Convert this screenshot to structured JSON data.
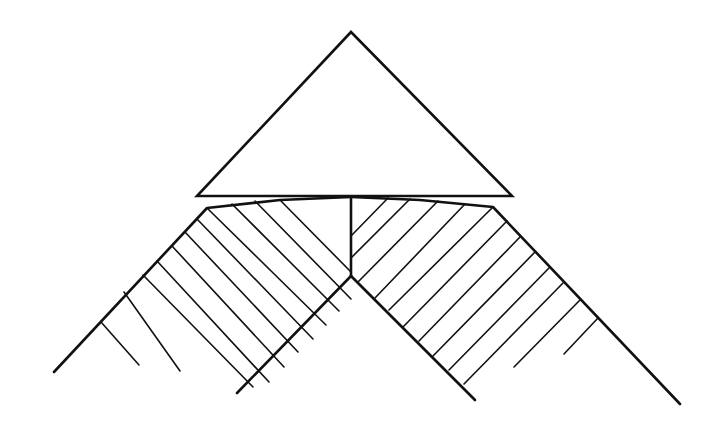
{
  "diagram": {
    "colors": {
      "ink": "#111111",
      "background": "#ffffff"
    },
    "triangle": {
      "points": [
        [
          351,
          32
        ],
        [
          512,
          196
        ],
        [
          197,
          196
        ]
      ]
    },
    "band_outline": {
      "left_outer": [
        [
          54,
          372
        ],
        [
          207,
          208
        ],
        [
          280,
          200
        ],
        [
          351,
          197
        ]
      ],
      "left_inner": [
        [
          237,
          393
        ],
        [
          351,
          276
        ]
      ],
      "right_outer": [
        [
          351,
          197
        ],
        [
          420,
          200
        ],
        [
          493,
          207
        ],
        [
          680,
          404
        ]
      ],
      "right_inner": [
        [
          351,
          276
        ],
        [
          475,
          400
        ]
      ],
      "center_divider": [
        [
          351,
          197
        ],
        [
          351,
          276
        ]
      ]
    },
    "hatch_lines": {
      "left": [
        [
          [
            280,
            200
          ],
          [
            351,
            272
          ]
        ],
        [
          [
            255,
            201
          ],
          [
            351,
            299
          ]
        ],
        [
          [
            232,
            204
          ],
          [
            339,
            311
          ]
        ],
        [
          [
            207,
            208
          ],
          [
            326,
            325
          ]
        ],
        [
          [
            197,
            219
          ],
          [
            313,
            339
          ]
        ],
        [
          [
            185,
            232
          ],
          [
            298,
            352
          ]
        ],
        [
          [
            172,
            246
          ],
          [
            284,
            367
          ]
        ],
        [
          [
            157,
            261
          ],
          [
            269,
            382
          ]
        ],
        [
          [
            143,
            275
          ],
          [
            253,
            387
          ]
        ],
        [
          [
            124,
            292
          ],
          [
            180,
            371
          ]
        ],
        [
          [
            101,
            322
          ],
          [
            139,
            365
          ]
        ]
      ],
      "right": [
        [
          [
            388,
            198
          ],
          [
            351,
            236
          ]
        ],
        [
          [
            410,
            199
          ],
          [
            351,
            258
          ]
        ],
        [
          [
            438,
            201
          ],
          [
            358,
            282
          ]
        ],
        [
          [
            465,
            204
          ],
          [
            375,
            298
          ]
        ],
        [
          [
            493,
            207
          ],
          [
            389,
            310
          ]
        ],
        [
          [
            507,
            221
          ],
          [
            403,
            327
          ]
        ],
        [
          [
            520,
            237
          ],
          [
            419,
            341
          ]
        ],
        [
          [
            535,
            252
          ],
          [
            433,
            356
          ]
        ],
        [
          [
            549,
            268
          ],
          [
            449,
            370
          ]
        ],
        [
          [
            563,
            283
          ],
          [
            464,
            384
          ]
        ],
        [
          [
            580,
            300
          ],
          [
            514,
            367
          ]
        ],
        [
          [
            598,
            318
          ],
          [
            564,
            354
          ]
        ]
      ]
    }
  }
}
